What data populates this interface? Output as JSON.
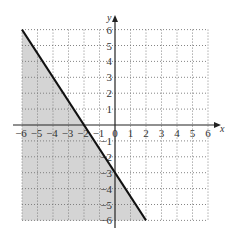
{
  "chart_data": {
    "type": "line",
    "title": "",
    "xlabel": "x",
    "ylabel": "y",
    "xlim": [
      -6,
      6
    ],
    "ylim": [
      -6,
      6
    ],
    "grid": true,
    "grid_style": "dotted",
    "x_ticks": [
      "-6",
      "-5",
      "-4",
      "-3",
      "-2",
      "-1",
      "0",
      "1",
      "2",
      "3",
      "4",
      "5",
      "6"
    ],
    "y_ticks": [
      "6",
      "5",
      "4",
      "3",
      "2",
      "1",
      "-1",
      "-2",
      "-3",
      "-4",
      "-5",
      "-6"
    ],
    "boundary_line": {
      "equation": "y = -3/2 x - 3",
      "style": "solid",
      "points": [
        [
          -6,
          6
        ],
        [
          -2,
          0
        ],
        [
          0,
          -3
        ],
        [
          2,
          -6
        ]
      ]
    },
    "shaded_region": {
      "inequality": "y <= -3/2 x - 3",
      "side": "below-left",
      "polygon": [
        [
          -6,
          6
        ],
        [
          2,
          -6
        ],
        [
          -6,
          -6
        ]
      ],
      "color": "#d4d4d4"
    }
  },
  "labels": {
    "x_axis": "x",
    "y_axis": "y",
    "origin": "0"
  }
}
